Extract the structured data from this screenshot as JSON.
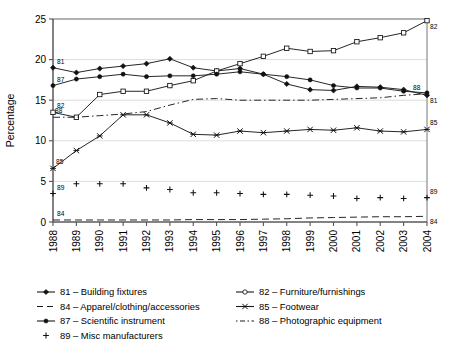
{
  "chart_data": {
    "type": "line",
    "title": "",
    "xlabel": "",
    "ylabel": "Percentage",
    "xlim": [
      1988,
      2004
    ],
    "ylim": [
      0,
      25
    ],
    "yticks": [
      0,
      5,
      10,
      15,
      20,
      25
    ],
    "ytick_labels": [
      "0",
      "5",
      "10",
      "15",
      "20",
      "25"
    ],
    "grid": "horizontal",
    "legend_position": "below-plot",
    "categories": [
      1988,
      1989,
      1990,
      1991,
      1992,
      1993,
      1994,
      1995,
      1996,
      1997,
      1998,
      1999,
      2000,
      2001,
      2002,
      2003,
      2004
    ],
    "xtick_labels": [
      "1988",
      "1989",
      "1990",
      "1991",
      "1992",
      "1993",
      "1994",
      "1995",
      "1996",
      "1997",
      "1998",
      "1999",
      "2000",
      "2001",
      "2002",
      "2003",
      "2004"
    ],
    "series": [
      {
        "code": "81",
        "name": "Building fixtures",
        "legend_label": "81 – Building fixtures",
        "marker": "filled-diamond",
        "linestyle": "solid",
        "endpoint_annotation": "81",
        "start_annotation": "81",
        "values": [
          19.0,
          18.4,
          18.9,
          19.2,
          19.5,
          20.1,
          19.0,
          18.6,
          18.9,
          18.2,
          17.0,
          16.3,
          16.2,
          16.7,
          16.6,
          16.3,
          15.6
        ]
      },
      {
        "code": "82",
        "name": "Furniture/furnishings",
        "legend_label": "82 – Furniture/furnishings",
        "marker": "open-square",
        "linestyle": "solid",
        "endpoint_annotation": "82",
        "start_annotation": "82",
        "values": [
          13.5,
          12.9,
          15.7,
          16.1,
          16.1,
          16.8,
          17.4,
          18.6,
          19.5,
          20.4,
          21.4,
          21.0,
          21.1,
          22.2,
          22.7,
          23.3,
          24.8
        ]
      },
      {
        "code": "84",
        "name": "Apparel/clothing/accessories",
        "legend_label": "84 – Apparel/clothing/accessories",
        "marker": "none",
        "linestyle": "dashed",
        "endpoint_annotation": "84",
        "start_annotation": "84",
        "values": [
          0.25,
          0.25,
          0.25,
          0.25,
          0.25,
          0.25,
          0.3,
          0.3,
          0.3,
          0.35,
          0.4,
          0.5,
          0.55,
          0.6,
          0.65,
          0.65,
          0.7
        ]
      },
      {
        "code": "85",
        "name": "Footwear",
        "legend_label": "85 – Footwear",
        "marker": "x-cross",
        "linestyle": "solid",
        "endpoint_annotation": "85",
        "start_annotation": "85",
        "values": [
          6.6,
          8.8,
          10.6,
          13.2,
          13.2,
          12.2,
          10.8,
          10.7,
          11.2,
          11.0,
          11.2,
          11.4,
          11.3,
          11.6,
          11.2,
          11.1,
          11.4
        ]
      },
      {
        "code": "87",
        "name": "Scientific instrument",
        "legend_label": "87 – Scientific instrument",
        "marker": "filled-circle",
        "linestyle": "solid",
        "endpoint_annotation": "",
        "start_annotation": "87",
        "values": [
          16.8,
          17.6,
          17.9,
          18.2,
          17.9,
          18.0,
          18.0,
          18.2,
          18.5,
          18.2,
          17.9,
          17.5,
          16.8,
          16.5,
          16.5,
          16.1,
          15.9
        ]
      },
      {
        "code": "88",
        "name": "Photographic equipment",
        "legend_label": "88 – Photographic equipment",
        "marker": "none",
        "linestyle": "dash-dot",
        "endpoint_annotation": "88",
        "start_annotation": "88",
        "values": [
          12.9,
          12.9,
          13.1,
          13.3,
          13.6,
          14.4,
          15.1,
          15.2,
          15.0,
          15.0,
          15.0,
          15.0,
          15.1,
          15.2,
          15.3,
          15.6,
          15.8
        ]
      },
      {
        "code": "89",
        "name": "Misc manufacturers",
        "legend_label": "89 – Misc manufacturers",
        "marker": "plus",
        "linestyle": "none",
        "endpoint_annotation": "89",
        "start_annotation": "89",
        "values": [
          3.5,
          4.7,
          4.7,
          4.7,
          4.2,
          4.0,
          3.6,
          3.6,
          3.5,
          3.4,
          3.4,
          3.3,
          3.2,
          2.9,
          3.0,
          2.9,
          3.0
        ]
      }
    ]
  },
  "legend": {
    "rows": [
      [
        {
          "code": "81",
          "label": "81 – Building fixtures",
          "marker": "filled-diamond",
          "linestyle": "solid"
        },
        {
          "code": "82",
          "label": "82 – Furniture/furnishings",
          "marker": "open-circle",
          "linestyle": "solid"
        }
      ],
      [
        {
          "code": "84",
          "label": "84 – Apparel/clothing/accessories",
          "marker": "none",
          "linestyle": "dashed"
        },
        {
          "code": "85",
          "label": "85 – Footwear",
          "marker": "x-cross",
          "linestyle": "solid"
        }
      ],
      [
        {
          "code": "87",
          "label": "87 – Scientific instrument",
          "marker": "filled-circle",
          "linestyle": "solid"
        },
        {
          "code": "88",
          "label": "88 – Photographic equipment",
          "marker": "none",
          "linestyle": "dash-dot"
        }
      ],
      [
        {
          "code": "89",
          "label": "89 – Misc manufacturers",
          "marker": "plus",
          "linestyle": "none"
        },
        null
      ]
    ]
  }
}
